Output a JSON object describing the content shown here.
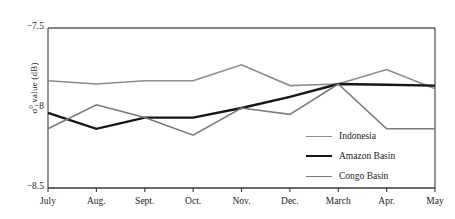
{
  "chart_data": {
    "type": "line",
    "title": "",
    "xlabel": "",
    "ylabel": "σ° value (dB)",
    "ylabel_base": "σ",
    "ylabel_sup": "0",
    "ylabel_rest": " value (dB)",
    "categories": [
      "July",
      "Aug.",
      "Sept.",
      "Oct.",
      "Nov.",
      "Dec.",
      "March",
      "Apr.",
      "May"
    ],
    "ylim": [
      -8.5,
      -7.5
    ],
    "ytick_values": [
      -7.5,
      -8.0,
      -8.5
    ],
    "ytick_labels": [
      "−7.5",
      "−8",
      "−8.5"
    ],
    "grid": false,
    "legend_position": "center-right-inside",
    "series": [
      {
        "name": "Indonesia",
        "color": "#8c8c8c",
        "width": 1.6,
        "values": [
          -7.83,
          -7.85,
          -7.83,
          -7.83,
          -7.73,
          -7.86,
          -7.85,
          -7.76,
          -7.88
        ]
      },
      {
        "name": "Amazon Basin",
        "color": "#161616",
        "width": 2.4,
        "values": [
          -8.03,
          -8.13,
          -8.06,
          -8.06,
          -8.0,
          -7.93,
          -7.85,
          -7.855,
          -7.86
        ]
      },
      {
        "name": "Congo Basin",
        "color": "#7a7a7a",
        "width": 1.6,
        "values": [
          -8.13,
          -7.98,
          -8.06,
          -8.17,
          -8.0,
          -8.04,
          -7.85,
          -8.13,
          -8.13
        ]
      }
    ]
  },
  "axes": {
    "y_tick_top": "−7.5",
    "y_tick_mid": "−8",
    "y_tick_bot": "−8.5"
  },
  "legend": {
    "items": [
      {
        "label": "Indonesia"
      },
      {
        "label": "Amazon Basin"
      },
      {
        "label": "Congo Basin"
      }
    ]
  }
}
